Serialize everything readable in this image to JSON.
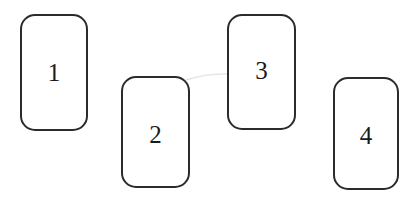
{
  "figure": {
    "background_color": "#ffffff",
    "width": 420,
    "height": 203,
    "stroke_color": "#2b2b2f",
    "label_color": "#1a1a1a"
  },
  "shapes": [
    {
      "label": "1",
      "name": "rounded-rectangle-1",
      "x": 20,
      "y": 14,
      "width": 68,
      "height": 117,
      "corner_radius": 15,
      "border_width": 2,
      "fill": "#ffffff",
      "stroke": "#2b2b2f",
      "label_font_size": 25,
      "label_color": "#1a1a1a",
      "label_offset_x": 0,
      "label_offset_y": 0
    },
    {
      "label": "2",
      "name": "rounded-rectangle-2",
      "x": 121,
      "y": 76,
      "width": 69,
      "height": 112,
      "corner_radius": 15,
      "border_width": 2,
      "fill": "#ffffff",
      "stroke": "#2b2b2f",
      "label_font_size": 25,
      "label_color": "#1a1a1a",
      "label_offset_x": 0,
      "label_offset_y": 2
    },
    {
      "label": "3",
      "name": "rounded-rectangle-3",
      "x": 227,
      "y": 14,
      "width": 69,
      "height": 116,
      "corner_radius": 15,
      "border_width": 2,
      "fill": "#ffffff",
      "stroke": "#2b2b2f",
      "label_font_size": 25,
      "label_color": "#1a1a1a",
      "label_offset_x": 0,
      "label_offset_y": -2
    },
    {
      "label": "4",
      "name": "rounded-rectangle-4",
      "x": 333,
      "y": 77,
      "width": 66,
      "height": 113,
      "corner_radius": 15,
      "border_width": 2,
      "fill": "#ffffff",
      "stroke": "#2b2b2f",
      "label_font_size": 25,
      "label_color": "#1a1a1a",
      "label_offset_x": 0,
      "label_offset_y": 2
    }
  ],
  "artifact": {
    "name": "scan-artifact-line",
    "visible": true,
    "color": "#e2e2e2",
    "x": 186,
    "y": 67,
    "width": 46,
    "height": 8
  }
}
